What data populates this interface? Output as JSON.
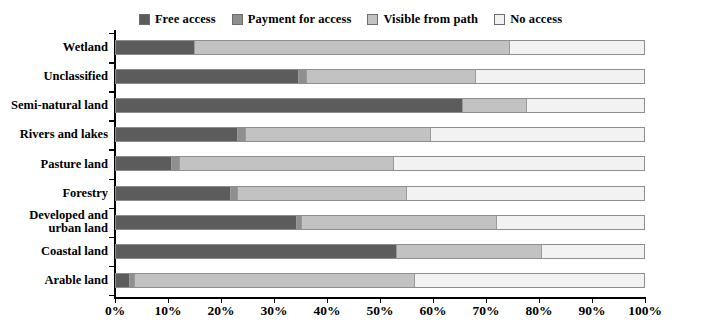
{
  "legend": {
    "position": "top-center",
    "entries": [
      {
        "label": "Free access",
        "color": "#5c5c5c"
      },
      {
        "label": "Payment for access",
        "color": "#8f8f8f"
      },
      {
        "label": "Visible from path",
        "color": "#c2c2c2"
      },
      {
        "label": "No access",
        "color": "#f2f2f2"
      }
    ]
  },
  "axis": {
    "x_ticks": [
      "0%",
      "10%",
      "20%",
      "30%",
      "40%",
      "50%",
      "60%",
      "70%",
      "80%",
      "90%",
      "100%"
    ],
    "x_min": 0,
    "x_max": 100
  },
  "chart_data": {
    "type": "bar",
    "orientation": "horizontal",
    "stacked": true,
    "stack_mode": "percent",
    "title": "",
    "subtitle": "",
    "xlabel": "",
    "ylabel": "",
    "xlim": [
      0,
      100
    ],
    "xticks": [
      0,
      10,
      20,
      30,
      40,
      50,
      60,
      70,
      80,
      90,
      100
    ],
    "xticklabels": [
      "0%",
      "10%",
      "20%",
      "30%",
      "40%",
      "50%",
      "60%",
      "70%",
      "80%",
      "90%",
      "100%"
    ],
    "grid": false,
    "legend_position": "top-center",
    "categories": [
      "Wetland",
      "Unclassified",
      "Semi-natural land",
      "Rivers and lakes",
      "Pasture land",
      "Forestry",
      "Developed and urban land",
      "Coastal land",
      "Arable land"
    ],
    "series": [
      {
        "name": "Free access",
        "color": "#5c5c5c",
        "values": [
          14.7,
          34.5,
          65.5,
          23.0,
          10.5,
          21.5,
          34.0,
          53.0,
          2.5
        ]
      },
      {
        "name": "Payment for access",
        "color": "#8f8f8f",
        "values": [
          0.0,
          1.5,
          0.0,
          1.5,
          1.5,
          1.5,
          1.0,
          0.0,
          1.0
        ]
      },
      {
        "name": "Visible from path",
        "color": "#c2c2c2",
        "values": [
          59.8,
          32.0,
          12.2,
          35.0,
          40.5,
          32.0,
          37.0,
          27.5,
          53.0
        ]
      },
      {
        "name": "No access",
        "color": "#f2f2f2",
        "values": [
          25.5,
          32.0,
          22.3,
          40.5,
          47.5,
          45.0,
          28.0,
          19.5,
          43.5
        ]
      }
    ]
  }
}
